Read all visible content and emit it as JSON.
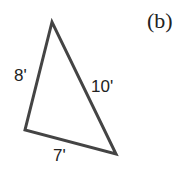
{
  "figure": {
    "part_label": "(b)",
    "shape": "triangle",
    "sides": [
      {
        "name": "left",
        "label": "8'"
      },
      {
        "name": "right",
        "label": "10'"
      },
      {
        "name": "bottom",
        "label": "7'"
      }
    ],
    "stroke_color": "#444444"
  }
}
